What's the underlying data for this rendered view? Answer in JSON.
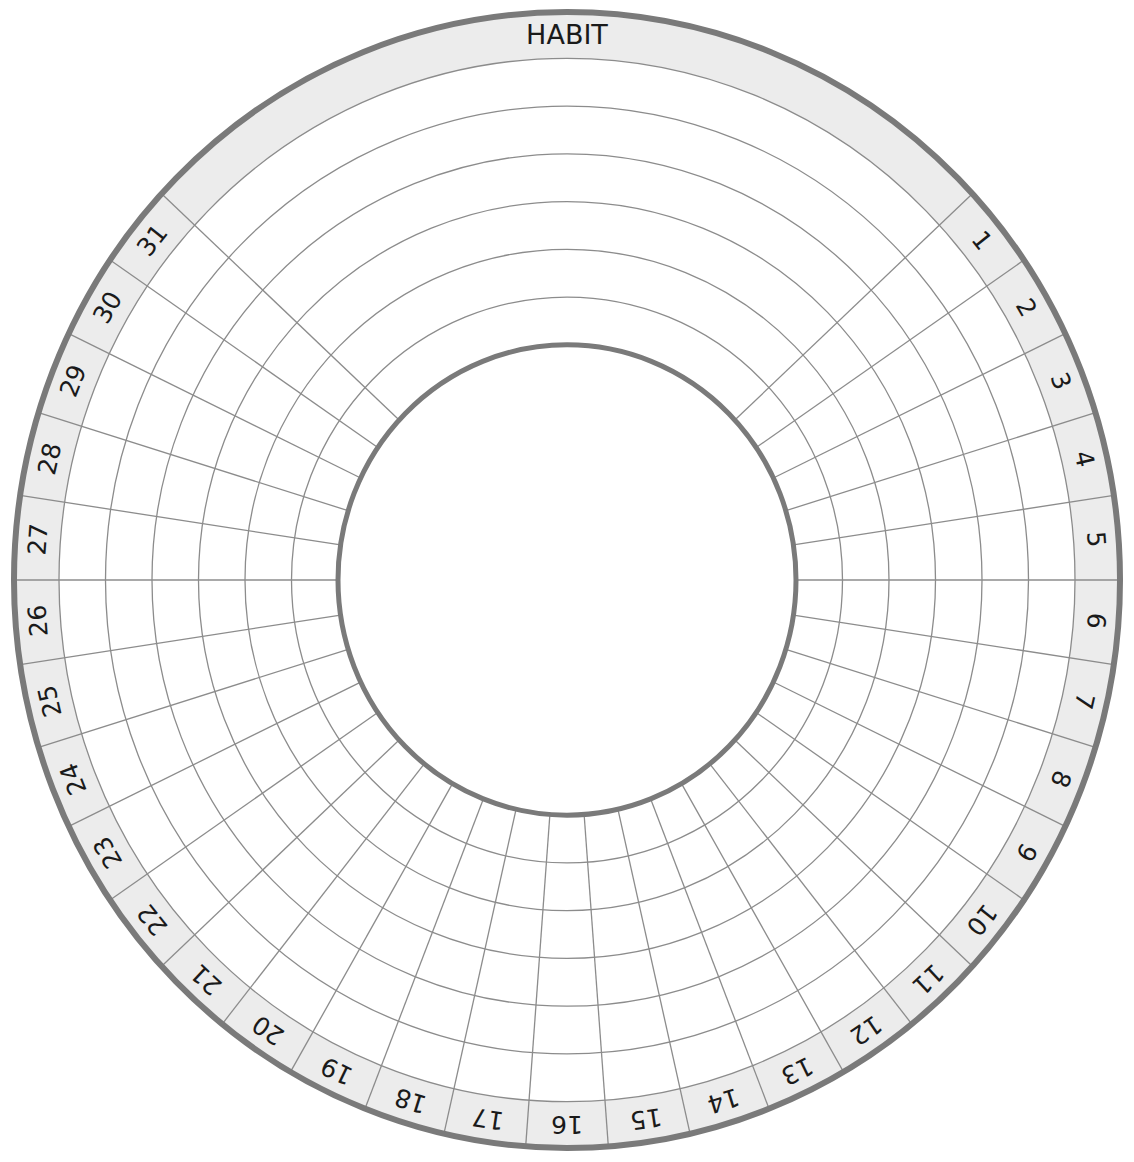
{
  "title": "HABIT",
  "days": [
    "1",
    "2",
    "3",
    "4",
    "5",
    "6",
    "7",
    "8",
    "9",
    "10",
    "11",
    "12",
    "13",
    "14",
    "15",
    "16",
    "17",
    "18",
    "19",
    "20",
    "21",
    "22",
    "23",
    "24",
    "25",
    "26",
    "27",
    "28",
    "29",
    "30",
    "31"
  ],
  "habit_rows": 6,
  "colors": {
    "band_fill": "#ececec",
    "grid_line": "#8c8c8c",
    "border_line": "#7a7a7a",
    "text": "#1a1a1a",
    "background": "#ffffff"
  },
  "geometry": {
    "cx": 567,
    "cy": 580,
    "y_scale": 1.027,
    "outer_radius": 553,
    "band_inner_radius": 508,
    "inner_radius": 229,
    "slot_deg": 8.5714,
    "first_day_start_deg": 47.143
  }
}
